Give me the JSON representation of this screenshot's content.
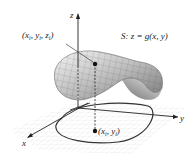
{
  "figure": {
    "axes": {
      "x_label": "x",
      "y_label": "y",
      "z_label": "z"
    },
    "surface_label": "S: z = g(x, y)",
    "surface_point_label": "(x_i, y_i, z_i)",
    "surface_point_label_parts": {
      "open": "(x",
      "sub1": "i",
      "mid1": ", y",
      "sub2": "i",
      "mid2": ", z",
      "sub3": "i",
      "close": ")"
    },
    "domain_point_label_parts": {
      "open": "(x",
      "sub1": "i",
      "mid1": ", y",
      "sub2": "i",
      "close": ")"
    },
    "domain_point_label": "(x_i, y_i)",
    "colors": {
      "surface_light": "#f2f2f2",
      "surface_dark": "#8a8a8a",
      "grid": "#cfcfcf",
      "axis": "#222222",
      "curve": "#333333"
    }
  }
}
